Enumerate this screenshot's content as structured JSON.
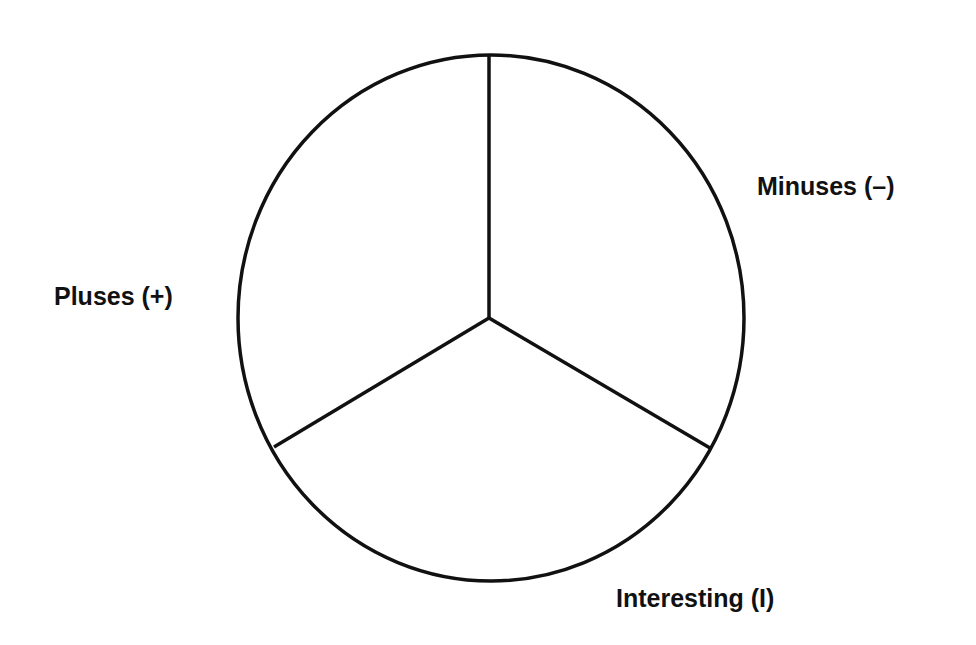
{
  "diagram": {
    "type": "PMI circle divided into three equal sectors",
    "stroke_color": "#111111",
    "background": "#ffffff",
    "sectors": [
      {
        "id": "pluses",
        "label": "Pluses (+)",
        "position": "left"
      },
      {
        "id": "minuses",
        "label": "Minuses (–)",
        "position": "right"
      },
      {
        "id": "interesting",
        "label": "Interesting (I)",
        "position": "bottom"
      }
    ]
  }
}
